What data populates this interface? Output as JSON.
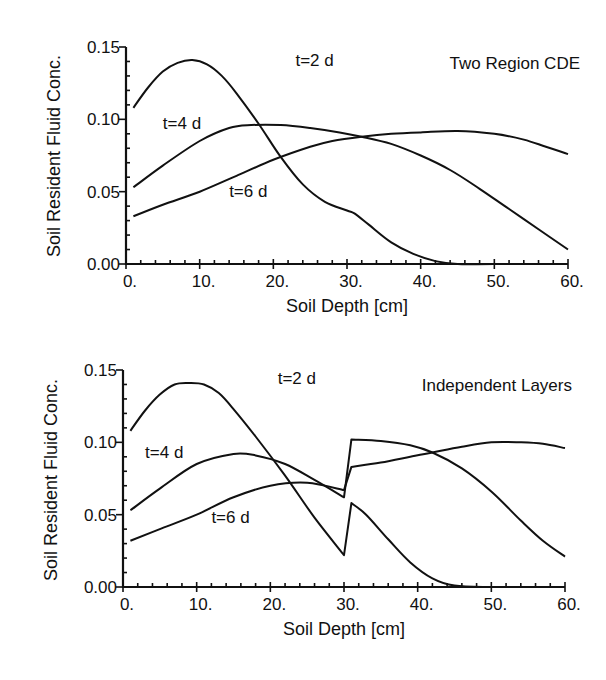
{
  "chart_data": [
    {
      "type": "line",
      "title": "Two Region CDE",
      "xlabel": "Soil Depth [cm]",
      "ylabel": "Soil Resident Fluid Conc.",
      "xlim": [
        0,
        60
      ],
      "ylim": [
        0,
        0.15
      ],
      "xticks": [
        "0.",
        "10.",
        "20.",
        "30.",
        "40.",
        "50.",
        "60."
      ],
      "yticks": [
        "0.00",
        "0.05",
        "0.10",
        "0.15"
      ],
      "grid": false,
      "legend": "inline labels",
      "series": [
        {
          "name": "t=2 d",
          "x": [
            1,
            3,
            5,
            7,
            9,
            11,
            13,
            15,
            18,
            21,
            24,
            27,
            30,
            31,
            33,
            36,
            39,
            42,
            45,
            50,
            60
          ],
          "values": [
            0.108,
            0.122,
            0.133,
            0.139,
            0.141,
            0.138,
            0.13,
            0.118,
            0.097,
            0.074,
            0.055,
            0.043,
            0.037,
            0.035,
            0.027,
            0.015,
            0.007,
            0.002,
            0.0,
            0.0,
            0.0
          ]
        },
        {
          "name": "t=4 d",
          "x": [
            1,
            5,
            10,
            14,
            17,
            21,
            25,
            29,
            32,
            36,
            40,
            44,
            48,
            52,
            56,
            60
          ],
          "values": [
            0.053,
            0.068,
            0.085,
            0.094,
            0.096,
            0.096,
            0.094,
            0.091,
            0.088,
            0.083,
            0.075,
            0.065,
            0.052,
            0.038,
            0.024,
            0.01
          ]
        },
        {
          "name": "t=6 d",
          "x": [
            1,
            5,
            10,
            15,
            20,
            25,
            28,
            32,
            36,
            40,
            45,
            50,
            54,
            57,
            60
          ],
          "values": [
            0.033,
            0.041,
            0.05,
            0.061,
            0.072,
            0.081,
            0.085,
            0.088,
            0.09,
            0.091,
            0.092,
            0.09,
            0.086,
            0.081,
            0.076
          ]
        }
      ],
      "labels": [
        {
          "text": "t=2 d",
          "x": 23,
          "y": 0.137
        },
        {
          "text": "t=4 d",
          "x": 5,
          "y": 0.093
        },
        {
          "text": "t=6 d",
          "x": 14,
          "y": 0.046
        }
      ]
    },
    {
      "type": "line",
      "title": "Independent Layers",
      "xlabel": "Soil Depth [cm]",
      "ylabel": "Soil Resident Fluid Conc.",
      "xlim": [
        0,
        60
      ],
      "ylim": [
        0,
        0.15
      ],
      "xticks": [
        "0.",
        "10.",
        "20.",
        "30.",
        "40.",
        "50.",
        "60."
      ],
      "yticks": [
        "0.00",
        "0.05",
        "0.10",
        "0.15"
      ],
      "grid": false,
      "legend": "inline labels",
      "series": [
        {
          "name": "t=2 d",
          "x": [
            1,
            3,
            5,
            7,
            9,
            11,
            13,
            15,
            18,
            22,
            26,
            30,
            31,
            33,
            36,
            39,
            42,
            45,
            50,
            60
          ],
          "values": [
            0.108,
            0.122,
            0.133,
            0.14,
            0.141,
            0.14,
            0.134,
            0.123,
            0.104,
            0.077,
            0.048,
            0.022,
            0.058,
            0.05,
            0.033,
            0.017,
            0.006,
            0.001,
            0.0,
            0.0
          ]
        },
        {
          "name": "t=4 d",
          "x": [
            1,
            5,
            10,
            15,
            18,
            22,
            26,
            30,
            31,
            35,
            39,
            42,
            46,
            50,
            54,
            57,
            60
          ],
          "values": [
            0.053,
            0.068,
            0.085,
            0.092,
            0.091,
            0.085,
            0.074,
            0.062,
            0.102,
            0.101,
            0.098,
            0.093,
            0.082,
            0.066,
            0.046,
            0.032,
            0.021
          ]
        },
        {
          "name": "t=6 d",
          "x": [
            1,
            5,
            10,
            15,
            20,
            25,
            30,
            31,
            35,
            39,
            42,
            46,
            50,
            54,
            57,
            60
          ],
          "values": [
            0.032,
            0.04,
            0.05,
            0.062,
            0.07,
            0.072,
            0.067,
            0.083,
            0.086,
            0.09,
            0.093,
            0.097,
            0.1,
            0.1,
            0.099,
            0.096
          ]
        }
      ],
      "labels": [
        {
          "text": "t=2 d",
          "x": 21,
          "y": 0.14
        },
        {
          "text": "t=4 d",
          "x": 3,
          "y": 0.089
        },
        {
          "text": "t=6 d",
          "x": 12,
          "y": 0.044
        }
      ]
    }
  ],
  "panels": [
    {
      "title": "Two Region CDE",
      "xlabel": "Soil Depth [cm]",
      "ylabel": "Soil Resident Fluid Conc."
    },
    {
      "title": "Independent Layers",
      "xlabel": "Soil Depth [cm]",
      "ylabel": "Soil Resident Fluid Conc."
    }
  ]
}
